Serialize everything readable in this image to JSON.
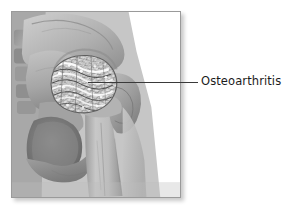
{
  "figure": {
    "kind": "medical-illustration",
    "view": "anterior view of right hip"
  },
  "callout": {
    "label": "Osteoarthritis",
    "leader_line_color": "#3a3a3a",
    "text_color": "#1c1c1c"
  },
  "illustration": {
    "frame_border_color": "#9a9a9a",
    "background_color": "#ffffff",
    "alt": "Grayscale drawing of a hip joint showing roughened, irregular bone at the femoral head indicating osteoarthritis",
    "regions": [
      {
        "name": "ilium",
        "tone": "#b4b4b4"
      },
      {
        "name": "sacrum",
        "tone": "#9e9e9e"
      },
      {
        "name": "acetabulum",
        "tone": "#8d8d8d"
      },
      {
        "name": "femoral-head-arthritic",
        "tone": "#e8e8e8"
      },
      {
        "name": "greater-trochanter",
        "tone": "#a8a8a8"
      },
      {
        "name": "femoral-shaft",
        "tone": "#bdbdbd"
      },
      {
        "name": "obturator-foramen",
        "tone": "#6b6b6b"
      },
      {
        "name": "pubic-ramus",
        "tone": "#a0a0a0"
      },
      {
        "name": "ischium",
        "tone": "#949494"
      }
    ]
  },
  "colors": {
    "page_background": "#ffffff",
    "bone_light": "#d2d2d2",
    "bone_mid": "#ababab",
    "bone_dark": "#777777",
    "shadow": "rgba(0,0,0,0.22)"
  }
}
